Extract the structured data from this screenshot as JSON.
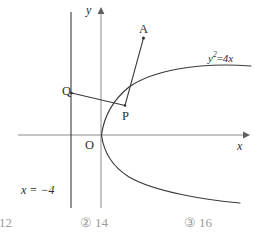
{
  "figure": {
    "type": "coordinate-geometry-diagram",
    "axes": {
      "x_label": "x",
      "y_label": "y"
    },
    "origin_label": "O",
    "curve_label_parts": {
      "base": "y",
      "exponent": "2",
      "operator": "=",
      "right": "4x"
    },
    "curve_label_plain": "y²=4x",
    "directrix_label": "x = −4",
    "points": [
      {
        "name": "P",
        "label": "P"
      },
      {
        "name": "Q",
        "label": "Q"
      },
      {
        "name": "A",
        "label": "A"
      }
    ],
    "colors": {
      "curve": "#3a3a3a",
      "axis": "#8a8a8a",
      "directrix": "#3a3a3a",
      "segment": "#3a3a3a",
      "label": "#2e2e2e",
      "option_text": "#9a9a9a",
      "background": "#ffffff"
    }
  },
  "options": [
    {
      "mark": "",
      "value": "12"
    },
    {
      "mark": "②",
      "value": "14"
    },
    {
      "mark": "③",
      "value": "16"
    }
  ]
}
